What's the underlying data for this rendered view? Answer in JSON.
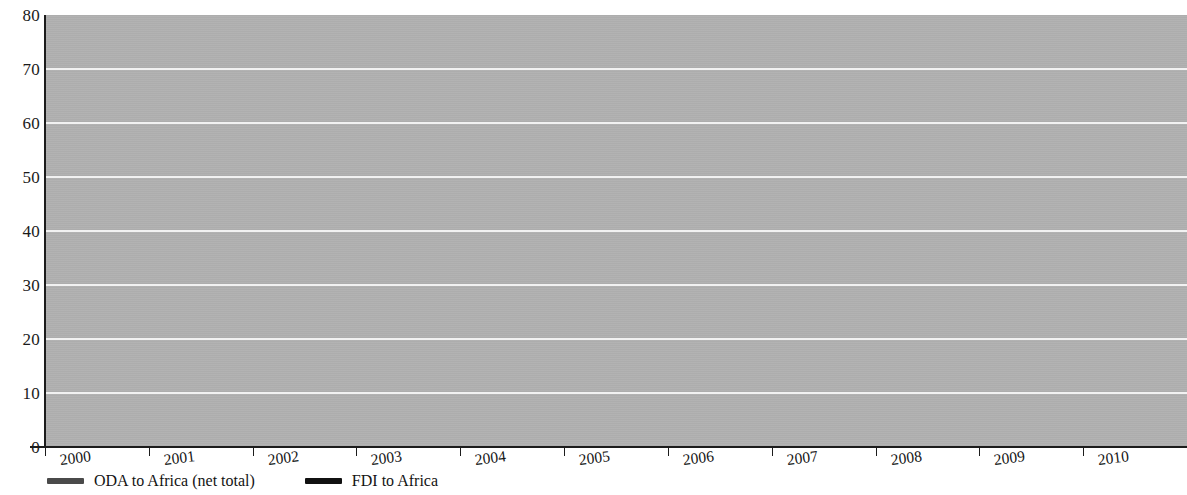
{
  "chart_data": {
    "type": "line",
    "title": "",
    "subtitle": "",
    "xlabel": "",
    "ylabel": "",
    "x": [
      "2000",
      "2001",
      "2002",
      "2003",
      "2004",
      "2005",
      "2006",
      "2007",
      "2008",
      "2009",
      "2010",
      "2011"
    ],
    "xlim": [
      2000,
      2011
    ],
    "ylim": [
      0,
      80
    ],
    "y_ticks": [
      0,
      10,
      20,
      30,
      40,
      50,
      60,
      70,
      80
    ],
    "grid": true,
    "grid_orientation": "horizontal",
    "grid_color": "#f2f2f2",
    "plot_background": "#b0b0b0",
    "legend_position": "bottom-left",
    "series": [
      {
        "name": "ODA to Africa (net total)",
        "color": "#4a4a4a",
        "line_width": 5,
        "values": [
          15.8,
          17.5,
          21.0,
          27.5,
          29.8,
          34.5,
          44.3,
          38.7,
          43.0,
          47.5,
          50.0,
          52.6
        ]
      },
      {
        "name": "FDI to Africa",
        "color": "#111111",
        "line_width": 5,
        "values": [
          10.2,
          20.4,
          16.2,
          20.6,
          21.8,
          34.5,
          55.4,
          63.0,
          72.4,
          58.8,
          50.0,
          59.4
        ]
      }
    ]
  },
  "axes": {
    "y_tick_labels": [
      "80",
      "70",
      "60",
      "50",
      "40",
      "30",
      "20",
      "10",
      "0"
    ],
    "x_tick_labels": [
      "2000",
      "2001",
      "2002",
      "2003",
      "2004",
      "2005",
      "2006",
      "2007",
      "2008",
      "2009",
      "2010",
      "2011"
    ]
  },
  "legend": {
    "items": [
      {
        "label": "ODA to Africa (net total)",
        "color": "#4a4a4a"
      },
      {
        "label": "FDI to Africa",
        "color": "#111111"
      }
    ]
  }
}
